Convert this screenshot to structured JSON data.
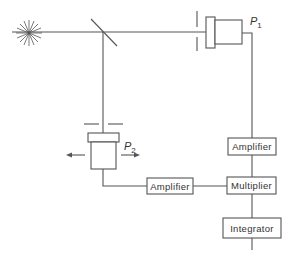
{
  "diagram": {
    "type": "block-optical-schematic",
    "colors": {
      "line": "#555555",
      "text": "#333333",
      "background": "#ffffff"
    },
    "components": {
      "source": {
        "label": "",
        "icon": "star-burst-light-source-icon"
      },
      "beam_splitter": {
        "label": "",
        "icon": "half-silvered-mirror-icon"
      },
      "detector_1": {
        "symbol": "P",
        "subscript": "1"
      },
      "detector_2": {
        "symbol": "P",
        "subscript": "2",
        "movement": "left-right-arrows"
      },
      "amplifier_1": {
        "label": "Amplifier"
      },
      "amplifier_2": {
        "label": "Amplifier"
      },
      "multiplier": {
        "label": "Multiplier"
      },
      "integrator": {
        "label": "Integrator"
      }
    },
    "connections": [
      [
        "source",
        "beam_splitter"
      ],
      [
        "beam_splitter",
        "detector_1"
      ],
      [
        "beam_splitter",
        "detector_2"
      ],
      [
        "detector_1",
        "amplifier_1"
      ],
      [
        "detector_2",
        "amplifier_2"
      ],
      [
        "amplifier_1",
        "multiplier"
      ],
      [
        "amplifier_2",
        "multiplier"
      ],
      [
        "multiplier",
        "integrator"
      ]
    ]
  }
}
